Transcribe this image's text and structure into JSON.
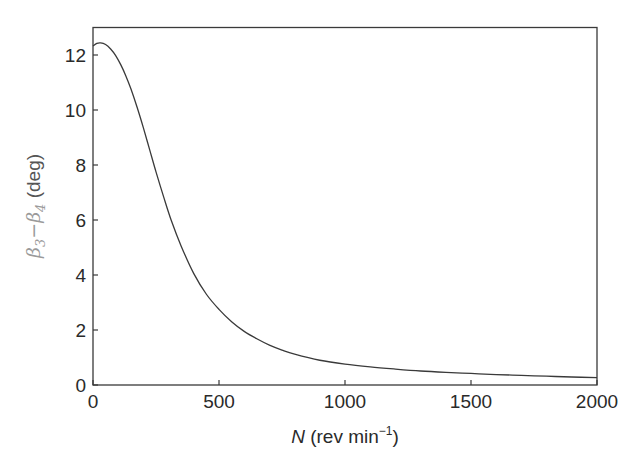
{
  "chart_data": {
    "type": "line",
    "title": "",
    "xlabel": "N (rev min−1)",
    "xlabel_parts": {
      "var": "N",
      "unit_prefix": " (rev min",
      "exponent": "−1",
      "unit_suffix": ")"
    },
    "ylabel": "β3−β4 (deg)",
    "ylabel_parts": {
      "b1": "β",
      "s1": "3",
      "dash": "−",
      "b2": "β",
      "s2": "4",
      "unit": " (deg)"
    },
    "xlim": [
      0,
      2000
    ],
    "ylim": [
      0,
      13
    ],
    "xticks": [
      0,
      500,
      1000,
      1500,
      2000
    ],
    "xtick_labels": [
      "0",
      "500",
      "1000",
      "1500",
      "2000"
    ],
    "yticks": [
      0,
      2,
      4,
      6,
      8,
      10,
      12
    ],
    "ytick_labels": [
      "0",
      "2",
      "4",
      "6",
      "8",
      "10",
      "12"
    ],
    "grid": false,
    "legend": null,
    "series": [
      {
        "name": "β3−β4",
        "color": "#3a3a3a",
        "x": [
          0,
          15,
          30,
          50,
          70,
          90,
          110,
          130,
          150,
          175,
          200,
          225,
          250,
          280,
          310,
          350,
          400,
          450,
          500,
          550,
          600,
          650,
          700,
          750,
          800,
          900,
          1000,
          1100,
          1200,
          1300,
          1400,
          1500,
          1600,
          1700,
          1800,
          1900,
          2000
        ],
        "y": [
          12.33,
          12.42,
          12.44,
          12.38,
          12.22,
          11.98,
          11.65,
          11.25,
          10.78,
          10.1,
          9.35,
          8.55,
          7.75,
          6.85,
          6.0,
          5.05,
          4.05,
          3.3,
          2.75,
          2.3,
          1.95,
          1.68,
          1.45,
          1.27,
          1.12,
          0.9,
          0.76,
          0.66,
          0.58,
          0.51,
          0.46,
          0.42,
          0.38,
          0.35,
          0.32,
          0.29,
          0.27
        ]
      }
    ]
  },
  "colors": {
    "axis": "#3a3a3a",
    "line": "#3a3a3a",
    "ylabel_greek": "#9a9a9a",
    "text": "#2a2a2a"
  }
}
